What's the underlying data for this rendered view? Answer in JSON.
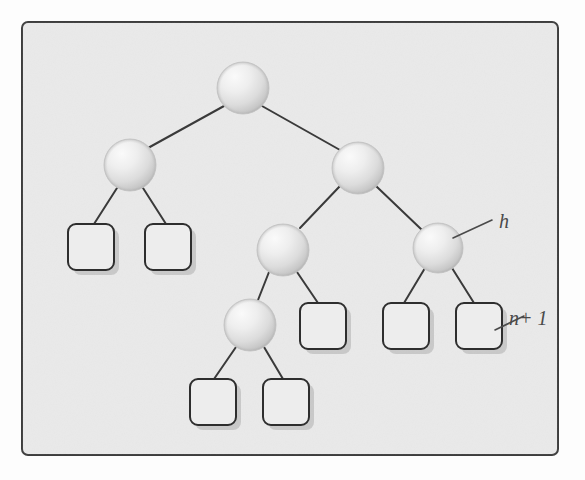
{
  "document": {
    "title": "Binary tree diagram with sphere and box nodes",
    "kind": "hand-drawn whiteboard sketch",
    "background_color": "#fdfdfd"
  },
  "frame": {
    "label": "slide-frame",
    "x": 22,
    "y": 22,
    "width": 536,
    "height": 433,
    "corner_radius": 6,
    "fill_color": "#e9e9e9",
    "border_color": "#3d3d3d",
    "border_width": 2
  },
  "style": {
    "sphere_fill_light": "#f3f3f3",
    "sphere_fill_mid": "#d8d8d8",
    "sphere_fill_dark": "#b8b8b8",
    "sphere_radius": 26,
    "box_fill": "#ededed",
    "box_border_color": "#2e2e2e",
    "box_border_width": 2,
    "box_corner_radius": 8,
    "box_width": 46,
    "box_height": 46,
    "edge_color": "#3a3a3a",
    "edge_width": 2,
    "shadow_color": "#bdbdbd",
    "annotation_color": "#4a4a4a"
  },
  "nodes": {
    "spheres": [
      {
        "id": "root",
        "name": "sphere-node-root",
        "cx": 243,
        "cy": 88,
        "r": 26
      },
      {
        "id": "left",
        "name": "sphere-node-left",
        "cx": 130,
        "cy": 165,
        "r": 26
      },
      {
        "id": "right",
        "name": "sphere-node-right",
        "cx": 358,
        "cy": 168,
        "r": 26
      },
      {
        "id": "mid",
        "name": "sphere-node-mid",
        "cx": 283,
        "cy": 250,
        "r": 26
      },
      {
        "id": "far-right",
        "name": "sphere-node-far-right",
        "cx": 438,
        "cy": 248,
        "r": 25
      },
      {
        "id": "bottom",
        "name": "sphere-node-bottom",
        "cx": 250,
        "cy": 325,
        "r": 26
      }
    ],
    "boxes": [
      {
        "id": "leaf-1",
        "name": "box-leaf-left-a",
        "x": 68,
        "y": 224,
        "w": 46,
        "h": 46
      },
      {
        "id": "leaf-2",
        "name": "box-leaf-left-b",
        "x": 145,
        "y": 224,
        "w": 46,
        "h": 46
      },
      {
        "id": "leaf-3",
        "name": "box-leaf-mid-right",
        "x": 300,
        "y": 303,
        "w": 46,
        "h": 46
      },
      {
        "id": "leaf-4",
        "name": "box-leaf-far-right-a",
        "x": 383,
        "y": 303,
        "w": 46,
        "h": 46
      },
      {
        "id": "leaf-5",
        "name": "box-leaf-far-right-b",
        "x": 456,
        "y": 303,
        "w": 46,
        "h": 46
      },
      {
        "id": "leaf-6",
        "name": "box-leaf-bottom-a",
        "x": 190,
        "y": 379,
        "w": 46,
        "h": 46
      },
      {
        "id": "leaf-7",
        "name": "box-leaf-bottom-b",
        "x": 263,
        "y": 379,
        "w": 46,
        "h": 46
      }
    ]
  },
  "edges": [
    {
      "name": "edge-root-left",
      "x1": 224,
      "y1": 106,
      "x2": 148,
      "y2": 148
    },
    {
      "name": "edge-root-right",
      "x1": 262,
      "y1": 106,
      "x2": 340,
      "y2": 150
    },
    {
      "name": "edge-left-leaf1",
      "x1": 117,
      "y1": 188,
      "x2": 94,
      "y2": 224
    },
    {
      "name": "edge-left-leaf2",
      "x1": 143,
      "y1": 188,
      "x2": 166,
      "y2": 224
    },
    {
      "name": "edge-right-mid",
      "x1": 340,
      "y1": 186,
      "x2": 300,
      "y2": 228
    },
    {
      "name": "edge-right-farright",
      "x1": 376,
      "y1": 186,
      "x2": 422,
      "y2": 230
    },
    {
      "name": "edge-mid-bottom",
      "x1": 269,
      "y1": 272,
      "x2": 258,
      "y2": 300
    },
    {
      "name": "edge-mid-leaf3",
      "x1": 297,
      "y1": 272,
      "x2": 318,
      "y2": 303
    },
    {
      "name": "edge-farright-leaf4",
      "x1": 425,
      "y1": 268,
      "x2": 404,
      "y2": 303
    },
    {
      "name": "edge-farright-leaf5",
      "x1": 452,
      "y1": 268,
      "x2": 474,
      "y2": 303
    },
    {
      "name": "edge-bottom-leaf6",
      "x1": 236,
      "y1": 347,
      "x2": 214,
      "y2": 379
    },
    {
      "name": "edge-bottom-leaf7",
      "x1": 264,
      "y1": 347,
      "x2": 283,
      "y2": 379
    }
  ],
  "annotations": [
    {
      "id": "ann-h",
      "name": "annotation-h",
      "text": "h",
      "text_x": 499,
      "text_y": 228,
      "font_size": 20,
      "leader": {
        "x1": 453,
        "y1": 238,
        "x2": 492,
        "y2": 220
      },
      "points_to": "sphere-node-far-right"
    },
    {
      "id": "ann-n-plus-1",
      "name": "annotation-n-plus-1",
      "text": "n+ 1",
      "text_x": 509,
      "text_y": 325,
      "font_size": 20,
      "leader": {
        "x1": 495,
        "y1": 330,
        "x2": 524,
        "y2": 316
      },
      "points_to": "box-leaf-far-right-b"
    }
  ]
}
